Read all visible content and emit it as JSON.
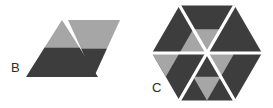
{
  "figure": {
    "background_color": "#ffffff",
    "width": 273,
    "height": 108,
    "gap_color": "#ffffff",
    "colors": {
      "dark_gray": "#3d3d3d",
      "light_gray": "#a6a6a6",
      "mid_gray": "#8f8f8f",
      "label_color": "#2b2b2b"
    },
    "panels": [
      {
        "id": "B",
        "label": "B",
        "label_x": 11,
        "label_y": 72,
        "shape_name": "rhombus-split-into-two-half-shaded-triangles",
        "piece_count": 2,
        "pieces": [
          {
            "name": "left-triangle-up",
            "orientation": "up",
            "top_fill": "light_gray",
            "bottom_fill": "dark_gray"
          },
          {
            "name": "right-triangle-down",
            "orientation": "down",
            "top_fill": "light_gray",
            "bottom_fill": "dark_gray"
          }
        ]
      },
      {
        "id": "C",
        "label": "C",
        "label_x": 152,
        "label_y": 92,
        "shape_name": "hexagon-of-six-half-shaded-triangles",
        "piece_count": 6,
        "pieces": [
          {
            "name": "sector-top",
            "angle_deg": 90,
            "base_fill": "dark_gray",
            "inner_fill": "light_gray"
          },
          {
            "name": "sector-upper-right",
            "angle_deg": 30,
            "base_fill": "dark_gray",
            "inner_fill": "light_gray"
          },
          {
            "name": "sector-lower-right",
            "angle_deg": 330,
            "base_fill": "dark_gray",
            "inner_fill": "light_gray"
          },
          {
            "name": "sector-bottom",
            "angle_deg": 270,
            "base_fill": "dark_gray",
            "inner_fill": "light_gray"
          },
          {
            "name": "sector-lower-left",
            "angle_deg": 210,
            "base_fill": "dark_gray",
            "inner_fill": "light_gray"
          },
          {
            "name": "sector-upper-left",
            "angle_deg": 150,
            "base_fill": "dark_gray",
            "inner_fill": "light_gray"
          }
        ]
      }
    ]
  }
}
